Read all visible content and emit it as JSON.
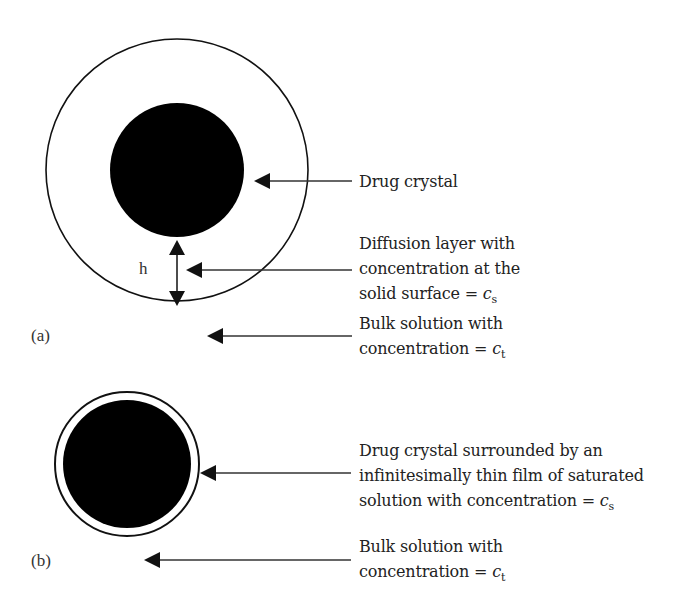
{
  "panel_a": {
    "label": "(a)",
    "h_label": "h",
    "drug_crystal": "Drug crystal",
    "diffusion_layer": {
      "line1": "Diffusion layer with",
      "line2": "concentration at the",
      "line3_prefix": "solid surface = ",
      "var": "c",
      "sub": "s"
    },
    "bulk": {
      "line1": "Bulk solution with",
      "line2_prefix": "concentration = ",
      "var": "c",
      "sub": "t"
    }
  },
  "panel_b": {
    "label": "(b)",
    "crystal_film": {
      "line1": "Drug crystal surrounded by an",
      "line2": "infinitesimally thin film of saturated",
      "line3_prefix": "solution with concentration = ",
      "var": "c",
      "sub": "s"
    },
    "bulk": {
      "line1": "Bulk solution with",
      "line2_prefix": "concentration = ",
      "var": "c",
      "sub": "t"
    }
  },
  "colors": {
    "ink": "#111111",
    "text": "#222222",
    "background": "#ffffff"
  }
}
